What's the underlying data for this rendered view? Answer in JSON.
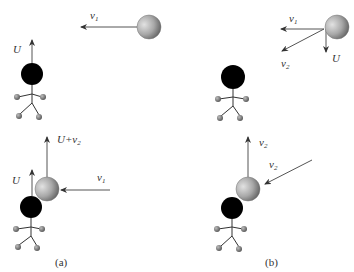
{
  "figure": {
    "panels": [
      {
        "id": "a",
        "caption": "(a)",
        "top_scene": {
          "ball_velocity_label": "v",
          "ball_velocity_sub": "1",
          "person_velocity_label": "U"
        },
        "bottom_scene": {
          "ball_out_label": "U+v",
          "ball_out_sub": "2",
          "person_velocity_label": "U",
          "ball_in_label": "v",
          "ball_in_sub": "1"
        }
      },
      {
        "id": "b",
        "caption": "(b)",
        "top_scene": {
          "v1_label": "v",
          "v1_sub": "1",
          "v2_label": "v",
          "v2_sub": "2",
          "u_label": "U"
        },
        "bottom_scene": {
          "ball_out_label": "v",
          "ball_out_sub": "2",
          "ball_in_label": "v",
          "ball_in_sub": "2"
        }
      }
    ],
    "colors": {
      "person_head": "#000000",
      "ball_light": "#d8d8d8",
      "ball_dark": "#6a6a6a",
      "hand_foot": "#8a8a8a",
      "arrow": "#555555"
    }
  }
}
